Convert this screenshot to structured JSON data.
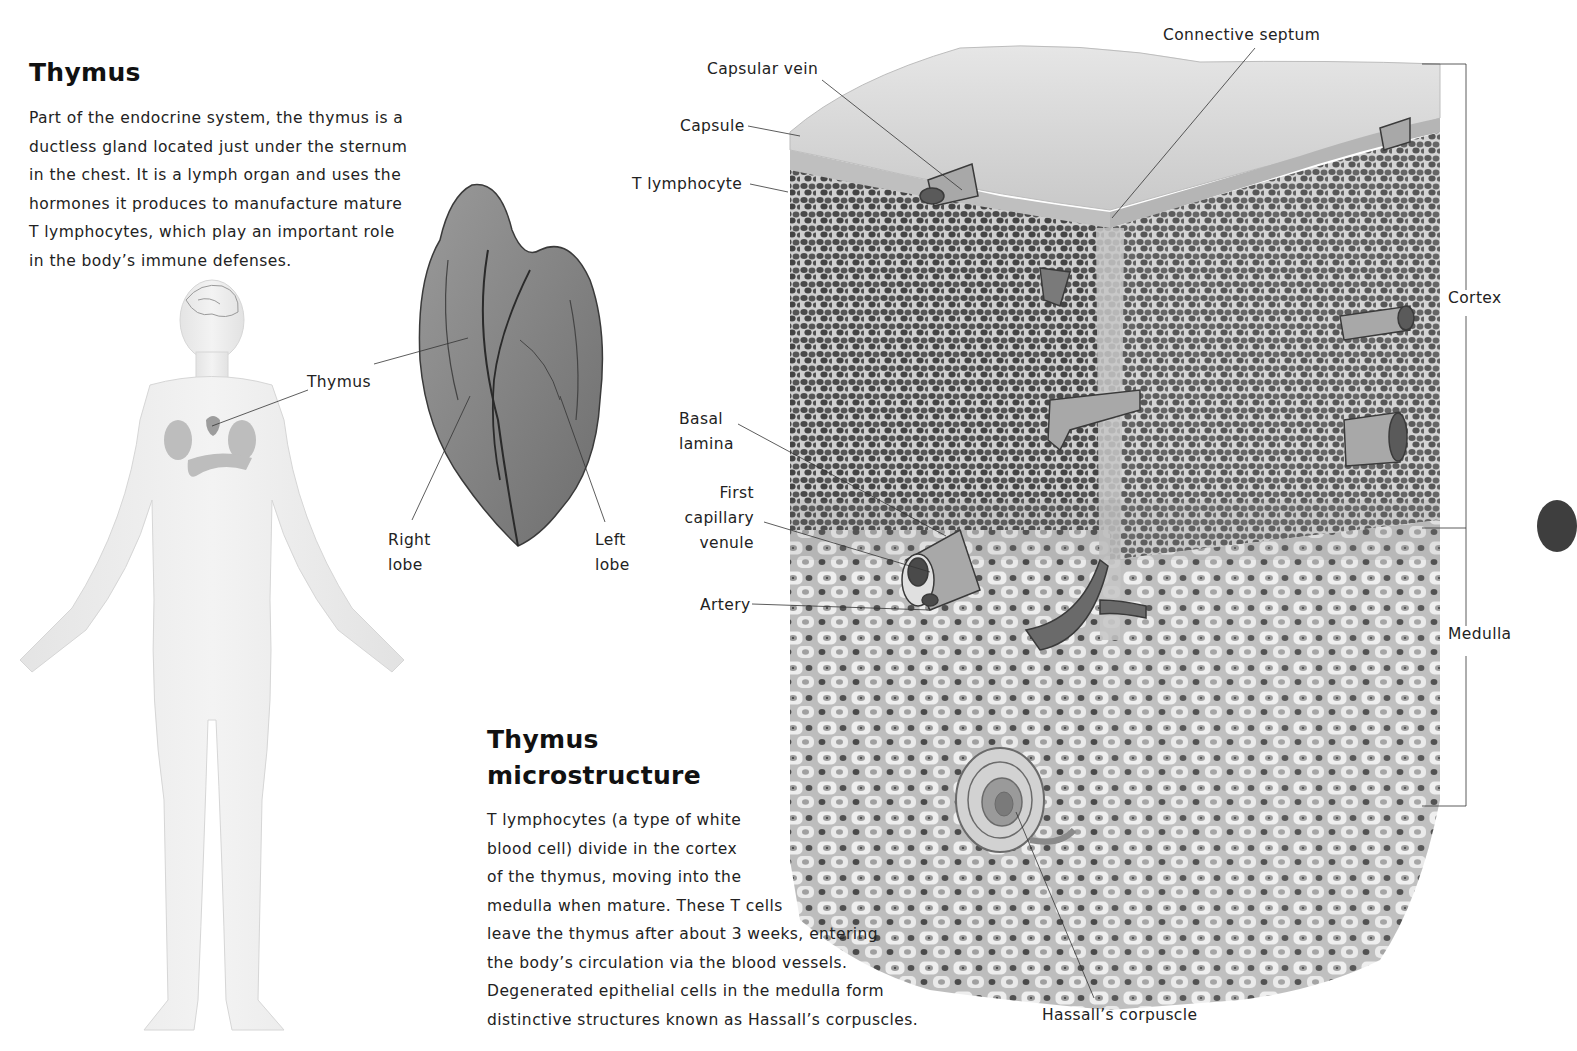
{
  "intro": {
    "title": "Thymus",
    "paragraph_lines": [
      "Part of the endocrine system, the thymus is a",
      "ductless gland located just under the sternum",
      "in the chest. It is a lymph organ and uses the",
      "hormones it produces to manufacture mature",
      "T lymphocytes, which play an important role",
      "in the body’s immune defenses."
    ]
  },
  "body_figure": {
    "icon": "human-body-figure",
    "labels": {
      "thymus": "Thymus"
    }
  },
  "gland_figure": {
    "icon": "thymus-gland-illustration",
    "labels": {
      "right_lobe": [
        "Right",
        "lobe"
      ],
      "left_lobe": [
        "Left",
        "lobe"
      ]
    }
  },
  "micro_figure": {
    "icon": "thymus-tissue-block-illustration",
    "labels": {
      "connective_septum": "Connective septum",
      "capsular_vein": "Capsular vein",
      "capsule": "Capsule",
      "t_lymphocyte": "T lymphocyte",
      "basal_lamina": [
        "Basal",
        "lamina"
      ],
      "first_capillary_venule": [
        "First",
        "capillary",
        "venule"
      ],
      "artery": "Artery",
      "hassalls_corpuscle": "Hassall’s corpuscle",
      "cortex": "Cortex",
      "medulla": "Medulla"
    }
  },
  "micro_text": {
    "title_lines": [
      "Thymus",
      "microstructure"
    ],
    "paragraph_lines": [
      "T lymphocytes (a type of white",
      "blood cell) divide in the cortex",
      "of the thymus, moving into the",
      "medulla when mature. These T cells",
      "leave the thymus after about 3 weeks, entering",
      "the body’s circulation via the blood vessels.",
      "Degenerated epithelial cells in the medulla form",
      "distinctive structures known as Hassall’s corpuscles."
    ]
  },
  "colors": {
    "text": "#222222",
    "cortex_tissue": "#5a5a5a",
    "medulla_tissue": "#d9d9d9",
    "capsule": "#c8c8c8",
    "body_figure": "#ececec",
    "page_tab": "#3e3e3e"
  }
}
